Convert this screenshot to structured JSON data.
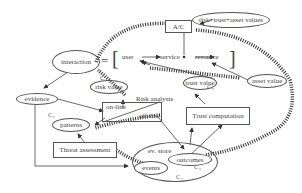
{
  "diagram": {
    "nodes": {
      "interaction": "interaction",
      "ac": "A/C",
      "risk_trust_asset": "risk+trust+asset values",
      "user": "user",
      "service": "service",
      "resource": "resource",
      "equals": "=",
      "bracket_open": "[",
      "bracket_close": "]",
      "asset_value": "asset value",
      "risk_value": "risk value",
      "trust_value": "trust value",
      "evidence": "evidence",
      "on_line": "on-line",
      "off_line": "off-line",
      "risk_analysis": "Risk analysis",
      "patterns": "patterns",
      "trust_computation": "Trust computation",
      "threat_assessment": "Threat assessment",
      "ev_store": "ev. store",
      "outcomes": "outcomes",
      "events": "events"
    },
    "cycle_labels": {
      "c1": "C₁",
      "c2": "C₂",
      "c3": "C₃",
      "c4": "C₄",
      "c5": "C₅"
    }
  }
}
